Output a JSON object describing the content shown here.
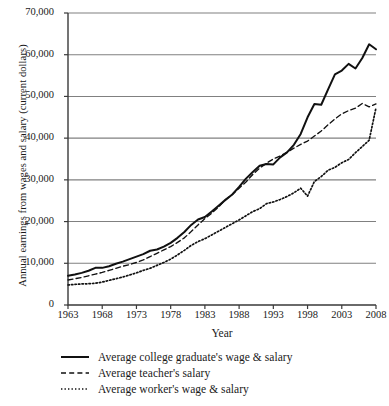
{
  "chart_data": {
    "type": "line",
    "title": "",
    "xlabel": "Year",
    "ylabel": "Annual earnings from wages and salary (current dollars)",
    "xlim": [
      1963,
      2008
    ],
    "ylim": [
      0,
      70000
    ],
    "grid": true,
    "gridlines_y": [
      10000,
      20000,
      30000,
      40000,
      50000,
      60000,
      70000
    ],
    "legend_position": "below",
    "xticks": [
      "1963",
      "1968",
      "1973",
      "1978",
      "1983",
      "1988",
      "1993",
      "1998",
      "2003",
      "2008"
    ],
    "xtick_values": [
      1963,
      1968,
      1973,
      1978,
      1983,
      1988,
      1993,
      1998,
      2003,
      2008
    ],
    "yticks": [
      "0",
      "10,000",
      "20,000",
      "30,000",
      "40,000",
      "50,000",
      "60,000",
      "70,000"
    ],
    "ytick_values": [
      0,
      10000,
      20000,
      30000,
      40000,
      50000,
      60000,
      70000
    ],
    "x": [
      1963,
      1964,
      1965,
      1966,
      1967,
      1968,
      1969,
      1970,
      1971,
      1972,
      1973,
      1974,
      1975,
      1976,
      1977,
      1978,
      1979,
      1980,
      1981,
      1982,
      1983,
      1984,
      1985,
      1986,
      1987,
      1988,
      1989,
      1990,
      1991,
      1992,
      1993,
      1994,
      1995,
      1996,
      1997,
      1998,
      1999,
      2000,
      2001,
      2002,
      2003,
      2004,
      2005,
      2006,
      2007,
      2008
    ],
    "series": [
      {
        "name": "Average college graduate's wage & salary",
        "style": "solid",
        "color": "#111111",
        "values": [
          7000,
          7300,
          7700,
          8200,
          8900,
          8900,
          9300,
          9900,
          10400,
          11000,
          11600,
          12200,
          13000,
          13300,
          14000,
          14900,
          16100,
          17500,
          19200,
          20500,
          21100,
          22400,
          23800,
          25200,
          26500,
          28300,
          30300,
          31900,
          33400,
          33800,
          33700,
          35400,
          36600,
          38400,
          41000,
          45000,
          48200,
          48000,
          51700,
          55300,
          56200,
          57800,
          56700,
          59200,
          62500,
          61300
        ]
      },
      {
        "name": "Average teacher's salary",
        "style": "dashed",
        "color": "#111111",
        "values": [
          6000,
          6300,
          6600,
          7000,
          7400,
          7800,
          8300,
          8800,
          9300,
          9700,
          10200,
          10800,
          11600,
          12400,
          13200,
          14000,
          15000,
          16100,
          17600,
          19200,
          20700,
          22000,
          23500,
          25200,
          26500,
          28000,
          29500,
          31300,
          32800,
          34000,
          35000,
          35700,
          36600,
          37600,
          38500,
          39300,
          40500,
          41700,
          43200,
          44600,
          45800,
          46600,
          47200,
          48300,
          47500,
          48200
        ]
      },
      {
        "name": "Average worker's wage & salary",
        "style": "dotted",
        "color": "#111111",
        "values": [
          4800,
          4950,
          5050,
          5100,
          5200,
          5500,
          5900,
          6300,
          6700,
          7200,
          7700,
          8300,
          8800,
          9500,
          10200,
          11000,
          12000,
          13100,
          14300,
          15200,
          15900,
          16800,
          17700,
          18600,
          19500,
          20400,
          21400,
          22400,
          23100,
          24300,
          24700,
          25300,
          26000,
          26900,
          28000,
          26100,
          29600,
          30800,
          32300,
          33000,
          34100,
          34900,
          36500,
          38000,
          39500,
          47300
        ]
      }
    ],
    "legend_entries": [
      {
        "label": "Average college graduate's wage & salary",
        "style": "solid"
      },
      {
        "label": "Average teacher's salary",
        "style": "dashed"
      },
      {
        "label": "Average worker's wage & salary",
        "style": "dotted"
      }
    ],
    "axis_color": "#3a3a3a",
    "grid_color": "#808080",
    "background": "#ffffff"
  }
}
